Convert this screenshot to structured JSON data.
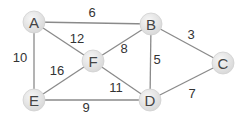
{
  "graph": {
    "nodes": [
      {
        "id": "A",
        "label": "A",
        "x": 34,
        "y": 22
      },
      {
        "id": "B",
        "label": "B",
        "x": 151,
        "y": 24
      },
      {
        "id": "C",
        "label": "C",
        "x": 223,
        "y": 63
      },
      {
        "id": "D",
        "label": "D",
        "x": 150,
        "y": 100
      },
      {
        "id": "E",
        "label": "E",
        "x": 34,
        "y": 100
      },
      {
        "id": "F",
        "label": "F",
        "x": 93,
        "y": 61
      }
    ],
    "edges": [
      {
        "from": "A",
        "to": "B",
        "weight": "6",
        "lx": 92,
        "ly": 14
      },
      {
        "from": "A",
        "to": "F",
        "weight": "12",
        "lx": 77,
        "ly": 40
      },
      {
        "from": "A",
        "to": "E",
        "weight": "10",
        "lx": 20,
        "ly": 59
      },
      {
        "from": "F",
        "to": "B",
        "weight": "8",
        "lx": 124,
        "ly": 50
      },
      {
        "from": "F",
        "to": "E",
        "weight": "16",
        "lx": 57,
        "ly": 72
      },
      {
        "from": "F",
        "to": "D",
        "weight": "11",
        "lx": 116,
        "ly": 89
      },
      {
        "from": "B",
        "to": "D",
        "weight": "5",
        "lx": 157,
        "ly": 61
      },
      {
        "from": "B",
        "to": "C",
        "weight": "3",
        "lx": 191,
        "ly": 36
      },
      {
        "from": "E",
        "to": "D",
        "weight": "9",
        "lx": 86,
        "ly": 109
      },
      {
        "from": "D",
        "to": "C",
        "weight": "7",
        "lx": 192,
        "ly": 95
      }
    ]
  },
  "style": {
    "node_fill": "#e6e6e6",
    "node_stroke": "#d0d0d0",
    "edge_color": "#8a8a8a",
    "label_color": "#333333"
  }
}
